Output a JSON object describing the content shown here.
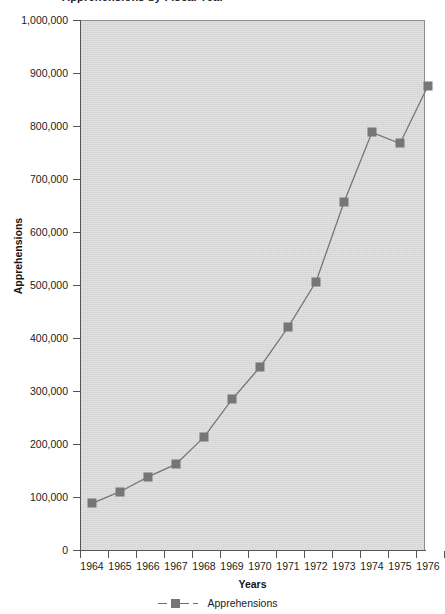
{
  "title_fragment": "Apprehensions by Fiscal Year",
  "chart_data": {
    "type": "line",
    "title": "Apprehensions by Fiscal Year",
    "xlabel": "Years",
    "ylabel": "Apprehensions",
    "x": [
      1964,
      1965,
      1966,
      1967,
      1968,
      1969,
      1970,
      1971,
      1972,
      1973,
      1974,
      1975,
      1976
    ],
    "categories": [
      "1964",
      "1965",
      "1966",
      "1967",
      "1968",
      "1969",
      "1970",
      "1971",
      "1972",
      "1973",
      "1974",
      "1975",
      "1976"
    ],
    "series": [
      {
        "name": "Apprehensions",
        "values": [
          88000,
          110000,
          138000,
          162000,
          213000,
          284000,
          345000,
          420000,
          506000,
          656000,
          788000,
          767000,
          876000
        ],
        "color": "#767676",
        "marker": "square",
        "linestyle": "solid"
      }
    ],
    "ylim": [
      0,
      1000000
    ],
    "ytick_values": [
      0,
      100000,
      200000,
      300000,
      400000,
      500000,
      600000,
      700000,
      800000,
      900000,
      1000000
    ],
    "ytick_labels": [
      "0",
      "100,000",
      "200,000",
      "300,000",
      "400,000",
      "500,000",
      "600,000",
      "700,000",
      "800,000",
      "900,000",
      "1,000,000"
    ],
    "xtick_labels": [
      "1964",
      "1965",
      "1966",
      "1967",
      "1968",
      "1969",
      "1970",
      "1971",
      "1972",
      "1973",
      "1974",
      "1975",
      "1976"
    ],
    "grid": false,
    "legend_position": "bottom",
    "plot_background": "#d9d9d9",
    "figure_background": "#ffffff",
    "axis_color": "#555555"
  },
  "legend": {
    "entries": [
      {
        "label": "Apprehensions",
        "color": "#767676",
        "marker": "square"
      }
    ]
  }
}
